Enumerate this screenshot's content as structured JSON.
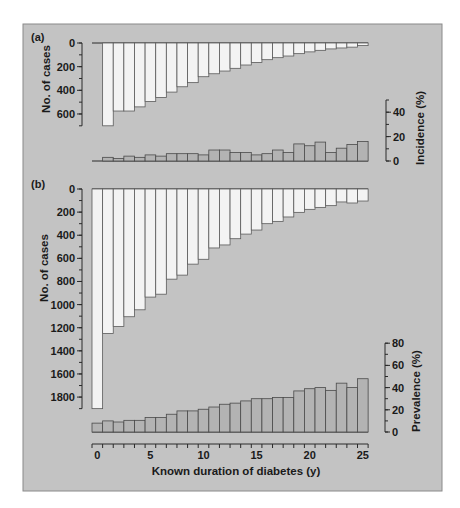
{
  "figure": {
    "colors": {
      "background": "#c3c3c3",
      "cases_bar": "#f3f3f3",
      "rate_bar": "#b3b3b3",
      "stroke": "#2a2a2a"
    }
  },
  "chart_data": [
    {
      "panel": "(a)",
      "type": "bar",
      "title": "",
      "xlabel": "Known duration of diabetes (y)",
      "x": [
        0,
        1,
        2,
        3,
        4,
        5,
        6,
        7,
        8,
        9,
        10,
        11,
        12,
        13,
        14,
        15,
        16,
        17,
        18,
        19,
        20,
        21,
        22,
        23,
        24,
        25
      ],
      "series": [
        {
          "name": "No. of cases",
          "axis": "left (inverted, downward)",
          "ylim": [
            0,
            700
          ],
          "ticks": [
            0,
            200,
            400,
            600
          ],
          "values": [
            null,
            700,
            575,
            575,
            540,
            495,
            460,
            415,
            370,
            335,
            285,
            260,
            237,
            214,
            186,
            164,
            141,
            124,
            110,
            90,
            75,
            62,
            50,
            42,
            35,
            22
          ]
        },
        {
          "name": "Incidence (%)",
          "axis": "right",
          "ylim": [
            0,
            50
          ],
          "ticks": [
            0,
            20,
            40
          ],
          "values": [
            null,
            3,
            2,
            4,
            3,
            5,
            4,
            6,
            6,
            6,
            5,
            9,
            9,
            7,
            7,
            5,
            6,
            9,
            7,
            14,
            12.5,
            15.5,
            7,
            10.5,
            13.5,
            16
          ]
        }
      ]
    },
    {
      "panel": "(b)",
      "type": "bar",
      "title": "",
      "xlabel": "Known duration of diabetes (y)",
      "x": [
        0,
        1,
        2,
        3,
        4,
        5,
        6,
        7,
        8,
        9,
        10,
        11,
        12,
        13,
        14,
        15,
        16,
        17,
        18,
        19,
        20,
        21,
        22,
        23,
        24,
        25
      ],
      "xticks": [
        0,
        5,
        10,
        15,
        20,
        25
      ],
      "series": [
        {
          "name": "No. of cases",
          "axis": "left (inverted, downward)",
          "ylim": [
            0,
            1900
          ],
          "ticks": [
            0,
            200,
            400,
            600,
            800,
            1000,
            1200,
            1400,
            1600,
            1800
          ],
          "values": [
            1900,
            1250,
            1190,
            1105,
            1045,
            935,
            910,
            780,
            745,
            650,
            608,
            510,
            484,
            430,
            390,
            355,
            300,
            280,
            242,
            202,
            176,
            159,
            144,
            112,
            121,
            104
          ]
        },
        {
          "name": "Prevalence (%)",
          "axis": "right",
          "ylim": [
            0,
            80
          ],
          "ticks": [
            0,
            20,
            40,
            60,
            80
          ],
          "values": [
            8,
            10,
            9,
            10.5,
            10.5,
            13,
            13,
            16,
            19,
            19,
            20.5,
            22.5,
            25,
            26,
            28,
            30,
            30,
            31,
            31,
            37,
            39,
            40,
            37.5,
            44,
            40,
            48
          ]
        }
      ]
    }
  ],
  "labels": {
    "panel_a": "(a)",
    "panel_b": "(b)",
    "cases_axis": "No. of cases",
    "incidence_axis": "Incidence (%)",
    "prevalence_axis": "Prevalence (%)",
    "x_axis": "Known duration of diabetes (y)"
  }
}
